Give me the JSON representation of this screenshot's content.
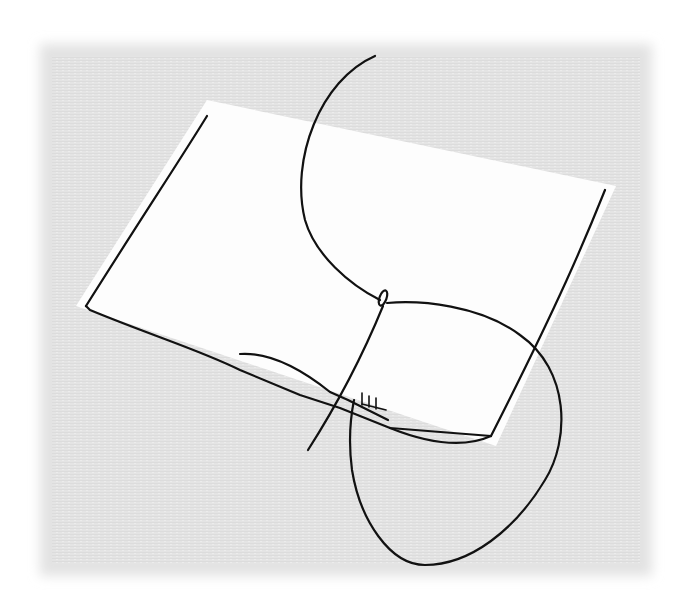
{
  "illustration": {
    "subject": "needle and thread stitching through the edge of a sheet of paper",
    "background": {
      "color": "#e6e6e6",
      "texture": "linen",
      "page_color": "#ffffff"
    },
    "paper": {
      "color": "#fdfdfd"
    },
    "ink_color": "#111111",
    "elements": [
      "paper-sheet",
      "paper-left-edge",
      "paper-bottom-edge",
      "paper-right-edge",
      "thread",
      "needle",
      "needle-eye",
      "stitches"
    ],
    "stitch_count": 3
  }
}
